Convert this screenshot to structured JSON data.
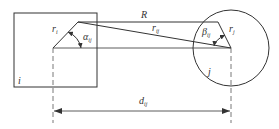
{
  "diagram": {
    "title": "",
    "colors": {
      "stroke": "#333333",
      "background": "#ffffff"
    },
    "labels": {
      "R": "R",
      "r_i_base": "r",
      "r_i_sub": "i",
      "r_j_base": "r",
      "r_j_sub": "j",
      "r_ij_base": "r",
      "r_ij_sub": "ij",
      "alpha_base": "α",
      "alpha_sub": "ij",
      "beta_base": "β",
      "beta_sub": "ij",
      "i": "i",
      "j": "j",
      "d_base": "d",
      "d_sub": "ij"
    },
    "shapes": {
      "square_i": {
        "x": 14,
        "y": 13,
        "w": 83,
        "h": 74
      },
      "circle_j": {
        "cx": 231,
        "cy": 48,
        "r": 38
      },
      "center_i": {
        "x": 53,
        "y": 48
      },
      "center_j": {
        "x": 231,
        "y": 48
      }
    }
  }
}
